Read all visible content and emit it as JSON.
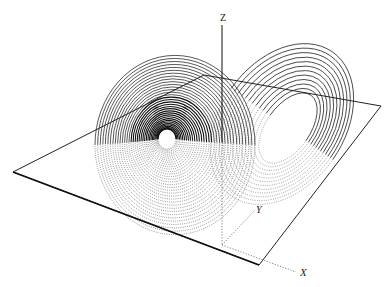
{
  "figure": {
    "axes": {
      "z_label": "Z",
      "y_label": "Y",
      "x_label": "X",
      "origin": [
        222,
        245
      ],
      "z_top": [
        222,
        25
      ],
      "z_plane_cross": [
        222,
        82
      ],
      "y_end": [
        255,
        210
      ],
      "x_end": [
        296,
        272
      ]
    },
    "plane": {
      "corners": [
        [
          204,
          75
        ],
        [
          381,
          106
        ],
        [
          259,
          265
        ],
        [
          13,
          172
        ]
      ],
      "stroke": "#222222"
    },
    "left_wing": {
      "center": [
        167,
        139
      ],
      "hole_radius": 7,
      "radii_min": 9,
      "radii_max": 80,
      "loops": 34,
      "squash": 1.12,
      "stroke": "#111111"
    },
    "right_wing": {
      "center": [
        288,
        128
      ],
      "rx_min": 22,
      "rx_max": 62,
      "ry_min": 40,
      "ry_max": 88,
      "rotation": 35,
      "loops": 12,
      "stroke": "#333333"
    },
    "colors": {
      "ink": "#111111",
      "paper": "#ffffff"
    }
  }
}
